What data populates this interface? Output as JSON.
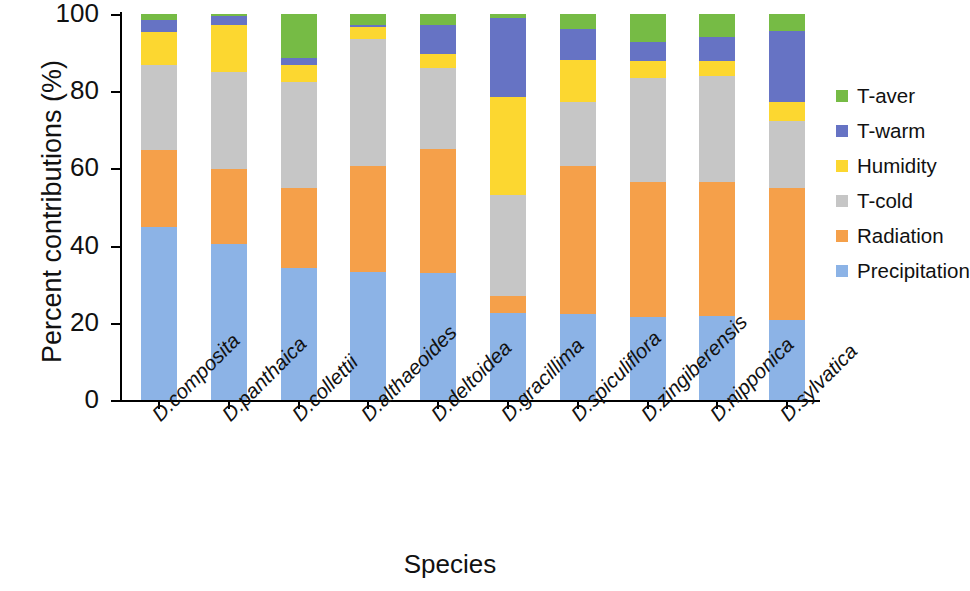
{
  "chart_data": {
    "type": "bar",
    "stacked": true,
    "stack_mode": "percent",
    "title": "",
    "xlabel": "Species",
    "ylabel": "Percent contributions (%)",
    "ylim": [
      0,
      100
    ],
    "yticks": [
      0,
      20,
      40,
      60,
      80,
      100
    ],
    "grid": false,
    "legend_position": "right",
    "categories": [
      "D.composita",
      "D.panthaica",
      "D.collettii",
      "D.althaeoides",
      "D.deltoidea",
      "D.gracillima",
      "D.spiculiflora",
      "D.zingiberensis",
      "D.nipponica",
      "D.sylvatica"
    ],
    "series": [
      {
        "name": "Precipitation",
        "color": "#8cb3e6",
        "values": [
          44.8,
          40.5,
          34.3,
          33.2,
          33.0,
          22.5,
          22.2,
          21.5,
          21.7,
          20.6
        ]
      },
      {
        "name": "Radiation",
        "color": "#f5a04a",
        "values": [
          20.0,
          19.4,
          20.7,
          27.4,
          32.0,
          4.4,
          38.3,
          35.0,
          34.8,
          34.2
        ]
      },
      {
        "name": "T-cold",
        "color": "#c6c6c6",
        "values": [
          22.0,
          25.1,
          27.5,
          32.9,
          21.0,
          26.2,
          16.6,
          27.0,
          27.4,
          17.4
        ]
      },
      {
        "name": "Humidity",
        "color": "#fcd730",
        "values": [
          8.5,
          12.1,
          4.4,
          3.0,
          3.6,
          25.3,
          11.1,
          4.2,
          3.9,
          5.0
        ]
      },
      {
        "name": "T-warm",
        "color": "#6673c4",
        "values": [
          3.2,
          2.4,
          1.6,
          0.7,
          7.5,
          20.6,
          8.0,
          5.0,
          6.3,
          18.4
        ]
      },
      {
        "name": "T-aver",
        "color": "#76bb45",
        "values": [
          1.5,
          0.5,
          11.5,
          2.8,
          2.9,
          1.0,
          3.8,
          7.3,
          5.9,
          4.4
        ]
      }
    ],
    "legend_entries": [
      {
        "label": "T-aver",
        "color": "#76bb45"
      },
      {
        "label": "T-warm",
        "color": "#6673c4"
      },
      {
        "label": "Humidity",
        "color": "#fcd730"
      },
      {
        "label": "T-cold",
        "color": "#c6c6c6"
      },
      {
        "label": "Radiation",
        "color": "#f5a04a"
      },
      {
        "label": "Precipitation",
        "color": "#8cb3e6"
      }
    ]
  }
}
